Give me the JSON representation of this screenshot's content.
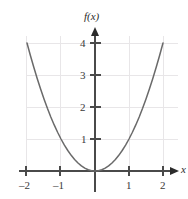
{
  "figure": {
    "width": 188,
    "height": 199,
    "background": "#ffffff"
  },
  "chart_data": {
    "type": "line",
    "title": "",
    "subtitle": "",
    "xlabel": "x",
    "ylabel": "f(x)",
    "function": "f(x) = x^2",
    "xlim": [
      -2.15,
      2.45
    ],
    "ylim": [
      -0.45,
      4.45
    ],
    "xticks": [
      -2,
      -1,
      1,
      2
    ],
    "yticks": [
      1,
      2,
      3,
      4
    ],
    "xtick_labels": [
      "–2",
      "–1",
      "1",
      "2"
    ],
    "ytick_labels": [
      "1",
      "2",
      "3",
      "4"
    ],
    "grid": true,
    "grid_color": "#e8e6e8",
    "legend": "none",
    "axis_color": "#4a4a4a",
    "curve_color": "#6a6a6a",
    "series": [
      {
        "name": "f(x) = x^2",
        "color": "#6a6a6a",
        "x": [
          -2,
          -1.9,
          -1.8,
          -1.7,
          -1.6,
          -1.5,
          -1.4,
          -1.3,
          -1.2,
          -1.1,
          -1,
          -0.9,
          -0.8,
          -0.7,
          -0.6,
          -0.5,
          -0.4,
          -0.3,
          -0.2,
          -0.1,
          0,
          0.1,
          0.2,
          0.3,
          0.4,
          0.5,
          0.6,
          0.7,
          0.8,
          0.9,
          1,
          1.1,
          1.2,
          1.3,
          1.4,
          1.5,
          1.6,
          1.7,
          1.8,
          1.9,
          2
        ],
        "y": [
          4,
          3.61,
          3.24,
          2.89,
          2.56,
          2.25,
          1.96,
          1.69,
          1.44,
          1.21,
          1,
          0.81,
          0.64,
          0.49,
          0.36,
          0.25,
          0.16,
          0.09,
          0.04,
          0.01,
          0,
          0.01,
          0.04,
          0.09,
          0.16,
          0.25,
          0.36,
          0.49,
          0.64,
          0.81,
          1,
          1.21,
          1.44,
          1.69,
          1.96,
          2.25,
          2.56,
          2.89,
          3.24,
          3.61,
          4
        ]
      }
    ]
  },
  "labels": {
    "y_axis_name": "f(x)",
    "x_axis_name": "x",
    "xtick_neg2": "–2",
    "xtick_neg1": "–1",
    "xtick_pos1": "1",
    "xtick_pos2": "2",
    "ytick_1": "1",
    "ytick_2": "2",
    "ytick_3": "3",
    "ytick_4": "4"
  }
}
